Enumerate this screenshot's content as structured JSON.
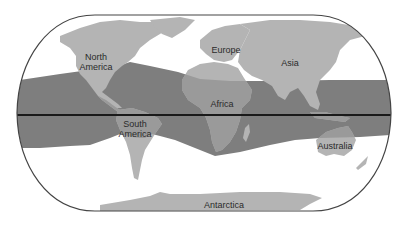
{
  "map": {
    "projection": "pseudocylindrical world map (rounded frame)",
    "colors": {
      "ocean": "#ffffff",
      "land": "#b4b4b4",
      "band": "#7e7e7e",
      "band_land": "#9a9a9a",
      "equator": "#1a1a1a",
      "frame": "#444444"
    },
    "highlighted_zone": "tropical band around the equator",
    "equator_line": true,
    "labels": {
      "north_america": [
        "North",
        "America"
      ],
      "europe": "Europe",
      "asia": "Asia",
      "africa": "Africa",
      "south_america": [
        "South",
        "America"
      ],
      "australia": "Australia",
      "antarctica": "Antarctica"
    }
  }
}
